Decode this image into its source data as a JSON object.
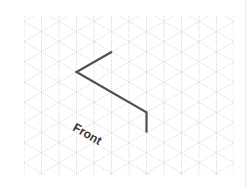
{
  "diagram": {
    "type": "isometric-grid-drawing",
    "grid": {
      "x0": 24,
      "x1": 234,
      "y0": 16,
      "y1": 175,
      "column_spacing": 17.5,
      "origin": [
        76.5,
        72
      ],
      "line_color": "#cfcfcf"
    },
    "stroke": {
      "color": "#505050",
      "width": 2.2,
      "points": [
        [
          112,
          51.8
        ],
        [
          76.5,
          72
        ],
        [
          146.5,
          112.4
        ],
        [
          146.5,
          132.6
        ]
      ]
    },
    "label": {
      "text": "Front",
      "x": 72,
      "y": 127,
      "rotation_deg": 30
    }
  }
}
